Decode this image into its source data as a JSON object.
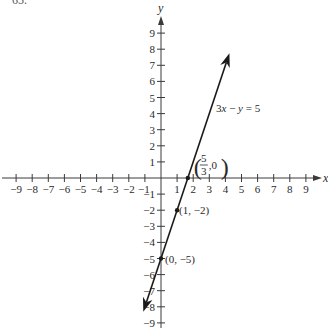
{
  "problem_number": "65.",
  "chart_data": {
    "type": "line",
    "title": "",
    "xlabel": "x",
    "ylabel": "y",
    "xlim": [
      -9,
      9
    ],
    "ylim": [
      -9,
      9
    ],
    "x_ticks": [
      -9,
      -8,
      -7,
      -6,
      -5,
      -4,
      -3,
      -2,
      -1,
      1,
      2,
      3,
      4,
      5,
      6,
      7,
      8,
      9
    ],
    "y_ticks": [
      -9,
      -8,
      -7,
      -6,
      -5,
      -4,
      -3,
      -2,
      -1,
      1,
      2,
      3,
      4,
      5,
      6,
      7,
      8,
      9
    ],
    "grid": false,
    "series": [
      {
        "name": "3x − y = 5",
        "equation": {
          "slope": 3,
          "intercept": -5
        },
        "x_range": [
          -1.1,
          4.25
        ],
        "arrows": "both",
        "color": "#1a1a1a"
      }
    ],
    "points": [
      {
        "x": 1.6667,
        "y": 0,
        "label_num": "5",
        "label_den": "3",
        "label_y": "0"
      },
      {
        "x": 1,
        "y": -2,
        "label": "(1, −2)"
      },
      {
        "x": 0,
        "y": -5,
        "label": "(0, −5)"
      }
    ],
    "annotations": [
      {
        "text_parts": [
          "3",
          "x",
          " − ",
          "y",
          " = 5"
        ],
        "anchor": "line-upper-right"
      }
    ]
  }
}
